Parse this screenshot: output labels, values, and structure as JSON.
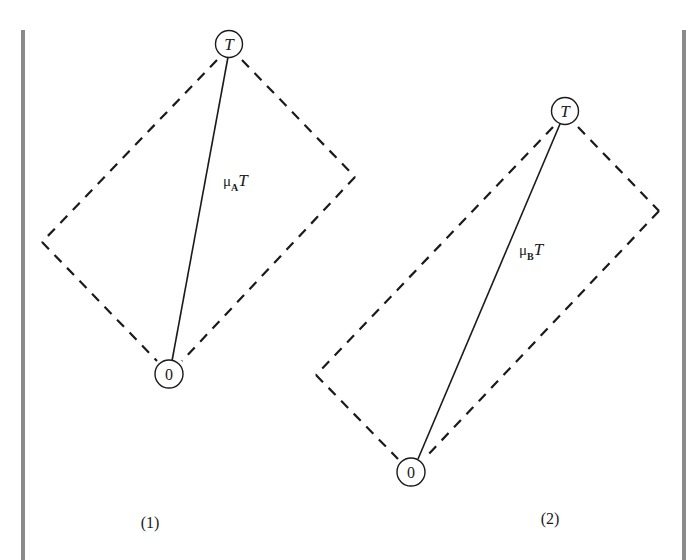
{
  "figure": {
    "style": {
      "line_color": "#1a1a1a",
      "frame_color": "#8a8a8a",
      "background": "#ffffff"
    },
    "panels": [
      {
        "id": "1",
        "caption": "(1)",
        "top_node": {
          "label": "T"
        },
        "bottom_node": {
          "label": "0"
        },
        "vector_label": {
          "mu": "μ",
          "sub": "A",
          "tail": "T"
        }
      },
      {
        "id": "2",
        "caption": "(2)",
        "top_node": {
          "label": "T"
        },
        "bottom_node": {
          "label": "0"
        },
        "vector_label": {
          "mu": "μ",
          "sub": "B",
          "tail": "T"
        }
      }
    ]
  }
}
